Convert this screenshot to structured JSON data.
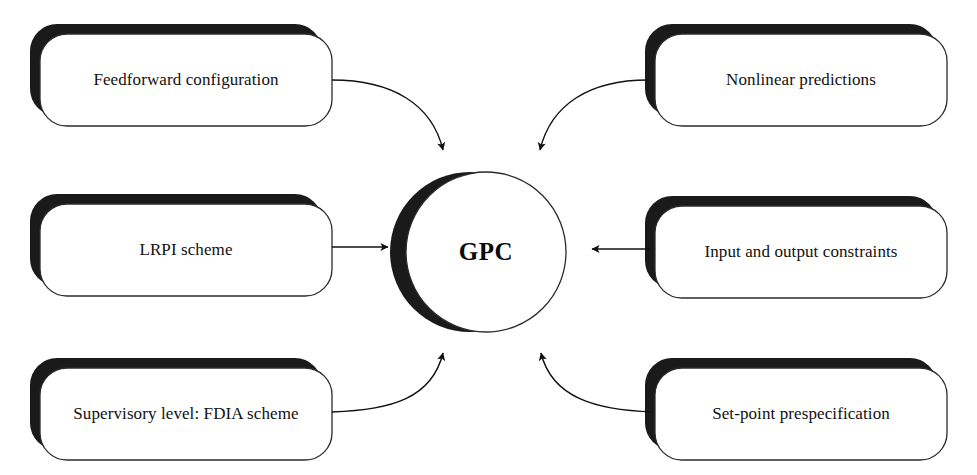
{
  "figure": {
    "background_color": "#ffffff",
    "ink_color": "#111111",
    "shadow_color": "#1a1a1a",
    "width": 977,
    "height": 475
  },
  "hub": {
    "label": "GPC",
    "shape": "circle",
    "cx": 486,
    "cy": 252,
    "r": 80,
    "shadow": "left-crescent"
  },
  "nodes": [
    {
      "id": "feedforward-configuration",
      "label": "Feedforward configuration",
      "position": "top-left",
      "x": 40,
      "y": 34,
      "w": 292,
      "h": 92
    },
    {
      "id": "lrpi-scheme",
      "label": "LRPI scheme",
      "position": "middle-left",
      "x": 40,
      "y": 204,
      "w": 292,
      "h": 92
    },
    {
      "id": "supervisory-level-fdia-scheme",
      "label": "Supervisory level: FDIA scheme",
      "position": "bottom-left",
      "x": 40,
      "y": 368,
      "w": 292,
      "h": 92
    },
    {
      "id": "nonlinear-predictions",
      "label": "Nonlinear predictions",
      "position": "top-right",
      "x": 655,
      "y": 34,
      "w": 292,
      "h": 92
    },
    {
      "id": "input-and-output-constraints",
      "label": "Input and output constraints",
      "position": "middle-right",
      "x": 655,
      "y": 206,
      "w": 292,
      "h": 92
    },
    {
      "id": "set-point-prespecification",
      "label": "Set-point prespecification",
      "position": "bottom-right",
      "x": 655,
      "y": 368,
      "w": 292,
      "h": 92
    }
  ],
  "connectors": [
    {
      "id": "feedforward-to-gpc",
      "from": "feedforward-configuration",
      "to": "hub",
      "style": "curved",
      "direction": "to-hub"
    },
    {
      "id": "lrpi-to-gpc",
      "from": "lrpi-scheme",
      "to": "hub",
      "style": "straight",
      "direction": "to-hub"
    },
    {
      "id": "fdia-to-gpc",
      "from": "supervisory-level-fdia-scheme",
      "to": "hub",
      "style": "curved",
      "direction": "to-hub"
    },
    {
      "id": "nonlinear-to-gpc",
      "from": "nonlinear-predictions",
      "to": "hub",
      "style": "curved",
      "direction": "to-hub"
    },
    {
      "id": "constraints-to-gpc",
      "from": "input-and-output-constraints",
      "to": "hub",
      "style": "straight",
      "direction": "to-hub"
    },
    {
      "id": "setpoint-to-gpc",
      "from": "set-point-prespecification",
      "to": "hub",
      "style": "curved",
      "direction": "to-hub"
    }
  ]
}
